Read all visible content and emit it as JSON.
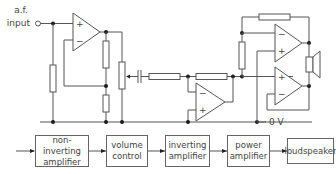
{
  "circuit": {
    "input_label_line1": "a.f.",
    "input_label_line2": "input",
    "ground_label": "0 V",
    "opamp1": {
      "plus": "+",
      "minus": "−"
    },
    "opamp2": {
      "minus": "−",
      "plus": "+"
    },
    "opamp3": {
      "minus": "−",
      "plus": "+"
    },
    "opamp4": {
      "plus": "+",
      "minus": "−"
    }
  },
  "block_diagram": {
    "blocks": [
      {
        "line1": "non-inverting",
        "line2": "amplifier"
      },
      {
        "line1": "volume",
        "line2": "control"
      },
      {
        "line1": "inverting",
        "line2": "amplifier"
      },
      {
        "line1": "power",
        "line2": "amplifier"
      },
      {
        "line1": "loudspeaker",
        "line2": ""
      }
    ]
  },
  "colors": {
    "wire": "#555555",
    "junction": "#1a1a1a",
    "text": "#444444"
  }
}
